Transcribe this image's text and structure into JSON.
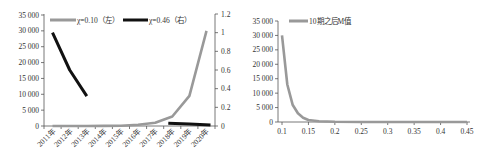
{
  "chart_data": [
    {
      "type": "line",
      "title": "",
      "xlabel": "",
      "ylabel": "",
      "categories": [
        "2011年",
        "2012年",
        "2013年",
        "2014年",
        "2015年",
        "2016年",
        "2017年",
        "2018年",
        "2019年",
        "2020年"
      ],
      "series": [
        {
          "name": "χ=0.10（左）",
          "axis": "left",
          "color": "#999999",
          "values": [
            0,
            0,
            0,
            20,
            100,
            400,
            1000,
            3000,
            9500,
            30000
          ]
        },
        {
          "name": "χ=0.46（右）",
          "axis": "right",
          "color": "#111111",
          "values": [
            1.0,
            0.6,
            0.32,
            null,
            null,
            null,
            null,
            0.03,
            0.02,
            0.01
          ]
        }
      ],
      "ylim_left": [
        0,
        35000
      ],
      "yticks_left": [
        "0",
        "5 000",
        "10 000",
        "15 000",
        "20 000",
        "25 000",
        "30 000",
        "35 000"
      ],
      "ylim_right": [
        0,
        1.2
      ],
      "yticks_right": [
        "0",
        "0.2",
        "0.4",
        "0.6",
        "0.8",
        "1",
        "1.2"
      ],
      "legend_position": "top",
      "grid": false
    },
    {
      "type": "line",
      "title": "",
      "xlabel": "",
      "ylabel": "",
      "series": [
        {
          "name": "10期之后M值",
          "color": "#999999",
          "x": [
            0.1,
            0.11,
            0.12,
            0.13,
            0.14,
            0.15,
            0.17,
            0.2,
            0.25,
            0.3,
            0.35,
            0.4,
            0.45
          ],
          "values": [
            30000,
            13000,
            6000,
            3000,
            1500,
            700,
            250,
            60,
            10,
            2,
            1,
            0,
            0
          ]
        }
      ],
      "xlim": [
        0.1,
        0.45
      ],
      "xticks": [
        "0.1",
        "0.15",
        "0.2",
        "0.25",
        "0.3",
        "0.35",
        "0.4",
        "0.45"
      ],
      "ylim": [
        0,
        35000
      ],
      "yticks": [
        "0",
        "5 000",
        "10 000",
        "15 000",
        "20 000",
        "25 000",
        "30 000",
        "35 000"
      ],
      "legend_position": "top-left",
      "grid": false
    }
  ],
  "legend": {
    "left": [
      "χ=0.10（左）",
      "χ=0.46（右）"
    ],
    "right": [
      "10期之后M值"
    ]
  }
}
